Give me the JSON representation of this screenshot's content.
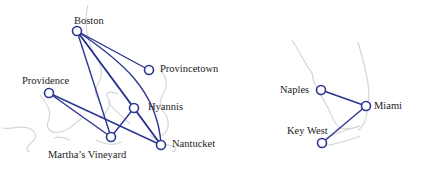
{
  "colors": {
    "edge": "#2a3591",
    "node_stroke": "#2a3591",
    "node_fill": "#ffffff",
    "coast": "#d4d6d8",
    "label": "#222222"
  },
  "graphs": [
    {
      "name": "new-england",
      "nodes": [
        {
          "id": "boston",
          "label": "Boston",
          "x": 77,
          "y": 31
        },
        {
          "id": "provincetown",
          "label": "Provincetown",
          "x": 149,
          "y": 70
        },
        {
          "id": "providence",
          "label": "Providence",
          "x": 49,
          "y": 93
        },
        {
          "id": "hyannis",
          "label": "Hyannis",
          "x": 134,
          "y": 108
        },
        {
          "id": "marthas-vineyard",
          "label": "Martha’s Vineyard",
          "x": 111,
          "y": 137
        },
        {
          "id": "nantucket",
          "label": "Nantucket",
          "x": 161,
          "y": 145
        }
      ],
      "edges": [
        [
          "boston",
          "provincetown"
        ],
        [
          "boston",
          "marthas-vineyard"
        ],
        [
          "boston",
          "hyannis"
        ],
        [
          "boston",
          "nantucket"
        ],
        [
          "providence",
          "marthas-vineyard"
        ],
        [
          "providence",
          "nantucket"
        ],
        [
          "marthas-vineyard",
          "hyannis"
        ],
        [
          "hyannis",
          "nantucket"
        ]
      ],
      "curved_edges": [
        [
          "boston",
          "nantucket"
        ]
      ]
    },
    {
      "name": "florida",
      "nodes": [
        {
          "id": "naples",
          "label": "Naples",
          "x": 321,
          "y": 90
        },
        {
          "id": "miami",
          "label": "Miami",
          "x": 366,
          "y": 106
        },
        {
          "id": "key-west",
          "label": "Key West",
          "x": 322,
          "y": 143
        }
      ],
      "edges": [
        [
          "naples",
          "miami"
        ],
        [
          "miami",
          "key-west"
        ]
      ]
    }
  ],
  "labels": {
    "boston": "Boston",
    "provincetown": "Provincetown",
    "providence": "Providence",
    "hyannis": "Hyannis",
    "marthas_vineyard": "Martha’s Vineyard",
    "nantucket": "Nantucket",
    "naples": "Naples",
    "miami": "Miami",
    "key_west": "Key West"
  }
}
